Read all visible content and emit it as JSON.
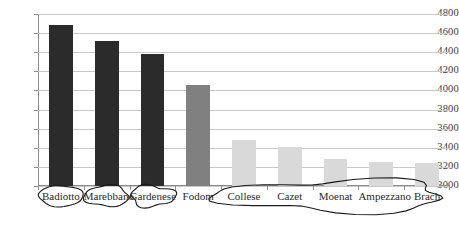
{
  "chart_data": {
    "type": "bar",
    "title": "",
    "subtitle": "",
    "xlabel": "",
    "ylabel": "",
    "categories": [
      "Badiotto",
      "Marebbano",
      "Gardenese",
      "Fodom",
      "Collese",
      "Cazet",
      "Moenat",
      "Ampezzano",
      "Brach"
    ],
    "values": [
      4690,
      4520,
      4385,
      4060,
      3480,
      3405,
      3280,
      3250,
      3240
    ],
    "bar_colors": [
      "#2b2b2b",
      "#2b2b2b",
      "#2b2b2b",
      "#808080",
      "#d9d9d9",
      "#d9d9d9",
      "#d9d9d9",
      "#d9d9d9",
      "#d9d9d9"
    ],
    "ylim": [
      3000,
      4800
    ],
    "ytick_step": 200,
    "ytick_labels": [
      "3000",
      "3200",
      "3400",
      "3600",
      "3800",
      "4000",
      "4200",
      "4400",
      "4600",
      "4800"
    ],
    "grid": true,
    "legend": "none",
    "annotations": [
      {
        "label": "Badiotto",
        "shape": "ellipse",
        "spans": [
          "Badiotto"
        ]
      },
      {
        "label": "Marebbano",
        "shape": "ellipse",
        "spans": [
          "Marebbano"
        ]
      },
      {
        "label": "Gardenese",
        "shape": "ellipse",
        "spans": [
          "Gardenese"
        ]
      },
      {
        "label": "Collese-Brach group",
        "shape": "ellipse",
        "spans": [
          "Collese",
          "Cazet",
          "Moenat",
          "Ampezzano",
          "Brach"
        ]
      }
    ]
  },
  "axis": {
    "y_labels": [
      "4800",
      "4600",
      "4400",
      "4200",
      "4000",
      "3800",
      "3600",
      "3400",
      "3200",
      "3000"
    ]
  },
  "categories": {
    "c0": "Badiotto",
    "c1": "Marebbano",
    "c2": "Gardenese",
    "c3": "Fodom",
    "c4": "Collese",
    "c5": "Cazet",
    "c6": "Moenat",
    "c7": "Ampezzano",
    "c8": "Brach"
  },
  "colors": {
    "dark_bar": "#2b2b2b",
    "medium_bar": "#808080",
    "light_bar": "#d9d9d9",
    "gridline": "#c9c9c9",
    "axis": "#8d8d8d",
    "annotation": "#1a1a1a"
  }
}
